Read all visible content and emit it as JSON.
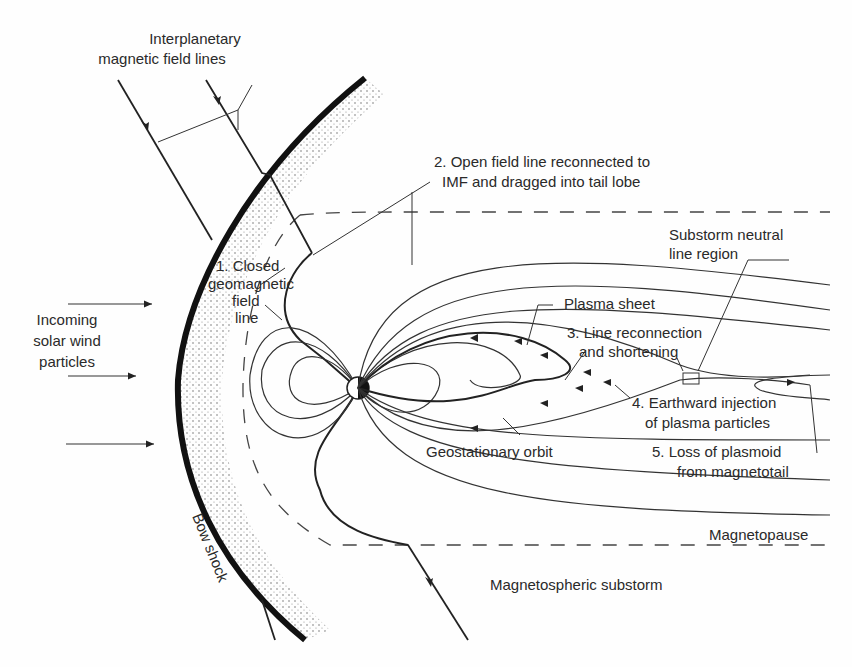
{
  "diagram": {
    "title": "Magnetospheric substorm",
    "labels": {
      "imf_line1": "Interplanetary",
      "imf_line2": "magnetic field lines",
      "step2_line1": "2. Open field line reconnected to",
      "step2_line2": "IMF and dragged into tail lobe",
      "neutral_line1": "Substorm neutral",
      "neutral_line2": "line region",
      "step1_line1": "1. Closed",
      "step1_line2": "geomagnetic",
      "step1_line3": "field",
      "step1_line4": "line",
      "solar_wind_line1": "Incoming",
      "solar_wind_line2": "solar wind",
      "solar_wind_line3": "particles",
      "plasma_sheet": "Plasma sheet",
      "step3_line1": "3. Line reconnection",
      "step3_line2": "and shortening",
      "step4_line1": "4. Earthward injection",
      "step4_line2": "of plasma particles",
      "geostationary": "Geostationary orbit",
      "step5_line1": "5. Loss of plasmoid",
      "step5_line2": "from magnetotail",
      "magnetopause": "Magnetopause",
      "bow_shock": "Bow shock",
      "caption": "Magnetospheric substorm"
    },
    "colors": {
      "line": "#222222",
      "text": "#2a2a2a",
      "background": "#fefefe"
    }
  }
}
